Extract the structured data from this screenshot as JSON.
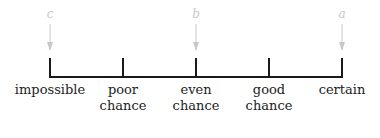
{
  "scale": {
    "labels": [
      {
        "text": "impossible",
        "x": 50
      },
      {
        "text": "poor chance",
        "x": 123
      },
      {
        "text": "even chance",
        "x": 196
      },
      {
        "text": "good chance",
        "x": 269
      },
      {
        "text": "certain",
        "x": 342
      }
    ],
    "label_lines": {
      "l0": [
        "impossible",
        ""
      ],
      "l1": [
        "poor",
        "chance"
      ],
      "l2": [
        "even",
        "chance"
      ],
      "l3": [
        "good",
        "chance"
      ],
      "l4": [
        "certain",
        ""
      ]
    }
  },
  "markers": {
    "c": {
      "letter": "c",
      "position": "impossible"
    },
    "b": {
      "letter": "b",
      "position": "even chance"
    },
    "a": {
      "letter": "a",
      "position": "certain"
    }
  },
  "colors": {
    "line": "#1a1a1a",
    "marker": "#c8c8c8"
  }
}
